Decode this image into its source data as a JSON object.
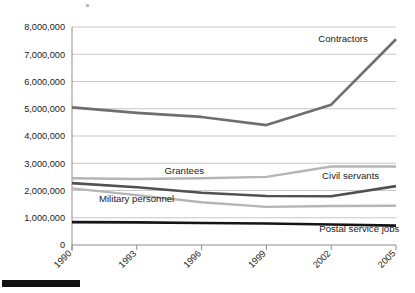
{
  "chart_data": {
    "type": "line",
    "title": "",
    "subtitle": "",
    "xlabel": "",
    "ylabel": "",
    "x": [
      1990,
      1993,
      1996,
      1999,
      2002,
      2005
    ],
    "xtick_labels": [
      "1990",
      "1993",
      "1996",
      "1999",
      "2002",
      "2005"
    ],
    "ylim": [
      0,
      8000000
    ],
    "ytick_values": [
      0,
      1000000,
      2000000,
      3000000,
      4000000,
      5000000,
      6000000,
      7000000,
      8000000
    ],
    "ytick_labels": [
      "0",
      "1,000,000",
      "2,000,000",
      "3,000,000",
      "4,000,000",
      "5,000,000",
      "6,000,000",
      "7,000,000",
      "8,000,000"
    ],
    "grid": true,
    "legend_position": "inline-labels",
    "series": [
      {
        "name": "Contractors",
        "color": "#6e6e6e",
        "width": 2.6,
        "label_x": 2002.55,
        "label_y": 7450000,
        "label_anchor": "middle",
        "values": [
          5050000,
          4850000,
          4700000,
          4400000,
          5150000,
          7550000
        ]
      },
      {
        "name": "Grantees",
        "color": "#b5b5b5",
        "width": 2.4,
        "label_x": 1995.2,
        "label_y": 2600000,
        "label_anchor": "middle",
        "values": [
          2450000,
          2420000,
          2450000,
          2500000,
          2880000,
          2880000
        ]
      },
      {
        "name": "Civil servants",
        "color": "#515151",
        "width": 2.6,
        "label_x": 2002.9,
        "label_y": 2420000,
        "label_anchor": "middle",
        "values": [
          2270000,
          2120000,
          1920000,
          1800000,
          1790000,
          2160000
        ]
      },
      {
        "name": "Military personnel",
        "color": "#b5b5b5",
        "width": 2.4,
        "label_x": 1991.25,
        "label_y": 1560000,
        "label_anchor": "start",
        "values": [
          2080000,
          1830000,
          1570000,
          1400000,
          1430000,
          1440000
        ]
      },
      {
        "name": "Postal service jobs",
        "color": "#151515",
        "width": 2.6,
        "label_x": 2003.3,
        "label_y": 480000,
        "label_anchor": "middle",
        "values": [
          840000,
          830000,
          810000,
          790000,
          750000,
          710000
        ]
      }
    ]
  },
  "axes": {
    "axis_color": "#8c8c8c",
    "grid_color": "#b9b9b9"
  }
}
